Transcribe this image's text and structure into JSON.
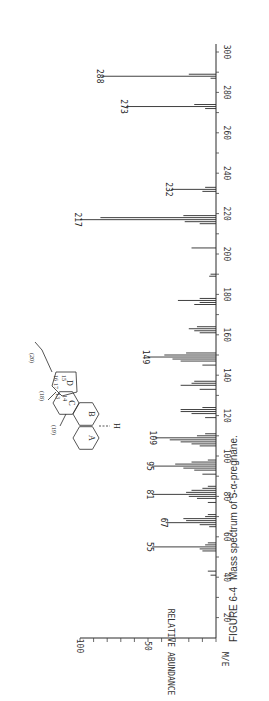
{
  "caption": {
    "figure": "FIGURE 6-4",
    "text": "Mass spectrum of 5-α-pregnane."
  },
  "axes": {
    "x_label": "M/E",
    "y_label": "RELATIVE ABUNDANCE",
    "x_ticks": [
      20,
      40,
      60,
      80,
      100,
      120,
      140,
      160,
      180,
      200,
      220,
      240,
      260,
      280,
      300
    ],
    "y_ticks": [
      50,
      100
    ]
  },
  "molecule": {
    "ring_labels": [
      "A",
      "B",
      "C",
      "D"
    ],
    "position_labels": [
      "(19)",
      "(18)",
      "(20)",
      "13",
      "14",
      "15",
      "16",
      "17"
    ],
    "h_label": "H"
  },
  "chart_data": {
    "type": "bar",
    "title": "Mass spectrum of 5-α-pregnane.",
    "xlabel": "M/E",
    "ylabel": "RELATIVE ABUNDANCE",
    "xlim": [
      20,
      300
    ],
    "ylim": [
      0,
      100
    ],
    "orientation": "rotated-90 (m/e axis vertical, abundance horizontal)",
    "grid": false,
    "labeled_peaks": [
      55,
      67,
      81,
      95,
      109,
      149,
      217,
      232,
      273,
      288
    ],
    "peaks": [
      {
        "mz": 41,
        "abundance": 4
      },
      {
        "mz": 43,
        "abundance": 6
      },
      {
        "mz": 53,
        "abundance": 10
      },
      {
        "mz": 54,
        "abundance": 12
      },
      {
        "mz": 55,
        "abundance": 47
      },
      {
        "mz": 56,
        "abundance": 8
      },
      {
        "mz": 57,
        "abundance": 6
      },
      {
        "mz": 65,
        "abundance": 5
      },
      {
        "mz": 66,
        "abundance": 12
      },
      {
        "mz": 67,
        "abundance": 37
      },
      {
        "mz": 68,
        "abundance": 22
      },
      {
        "mz": 69,
        "abundance": 24
      },
      {
        "mz": 70,
        "abundance": 8
      },
      {
        "mz": 71,
        "abundance": 6
      },
      {
        "mz": 77,
        "abundance": 6
      },
      {
        "mz": 79,
        "abundance": 14
      },
      {
        "mz": 80,
        "abundance": 20
      },
      {
        "mz": 81,
        "abundance": 47
      },
      {
        "mz": 82,
        "abundance": 22
      },
      {
        "mz": 83,
        "abundance": 18
      },
      {
        "mz": 84,
        "abundance": 10
      },
      {
        "mz": 85,
        "abundance": 6
      },
      {
        "mz": 91,
        "abundance": 10
      },
      {
        "mz": 93,
        "abundance": 16
      },
      {
        "mz": 94,
        "abundance": 24
      },
      {
        "mz": 95,
        "abundance": 47
      },
      {
        "mz": 96,
        "abundance": 30
      },
      {
        "mz": 97,
        "abundance": 18
      },
      {
        "mz": 98,
        "abundance": 6
      },
      {
        "mz": 105,
        "abundance": 12
      },
      {
        "mz": 106,
        "abundance": 18
      },
      {
        "mz": 107,
        "abundance": 26
      },
      {
        "mz": 108,
        "abundance": 34
      },
      {
        "mz": 109,
        "abundance": 45
      },
      {
        "mz": 110,
        "abundance": 14
      },
      {
        "mz": 111,
        "abundance": 8
      },
      {
        "mz": 119,
        "abundance": 8
      },
      {
        "mz": 121,
        "abundance": 18
      },
      {
        "mz": 122,
        "abundance": 26
      },
      {
        "mz": 123,
        "abundance": 26
      },
      {
        "mz": 124,
        "abundance": 10
      },
      {
        "mz": 133,
        "abundance": 12
      },
      {
        "mz": 135,
        "abundance": 26
      },
      {
        "mz": 136,
        "abundance": 18
      },
      {
        "mz": 137,
        "abundance": 16
      },
      {
        "mz": 145,
        "abundance": 10
      },
      {
        "mz": 147,
        "abundance": 26
      },
      {
        "mz": 148,
        "abundance": 32
      },
      {
        "mz": 149,
        "abundance": 50
      },
      {
        "mz": 150,
        "abundance": 38
      },
      {
        "mz": 151,
        "abundance": 22
      },
      {
        "mz": 161,
        "abundance": 12
      },
      {
        "mz": 162,
        "abundance": 16
      },
      {
        "mz": 163,
        "abundance": 20
      },
      {
        "mz": 164,
        "abundance": 14
      },
      {
        "mz": 175,
        "abundance": 16
      },
      {
        "mz": 176,
        "abundance": 12
      },
      {
        "mz": 177,
        "abundance": 28
      },
      {
        "mz": 178,
        "abundance": 12
      },
      {
        "mz": 189,
        "abundance": 5
      },
      {
        "mz": 190,
        "abundance": 4
      },
      {
        "mz": 203,
        "abundance": 18
      },
      {
        "mz": 215,
        "abundance": 12
      },
      {
        "mz": 216,
        "abundance": 23
      },
      {
        "mz": 217,
        "abundance": 100
      },
      {
        "mz": 218,
        "abundance": 85
      },
      {
        "mz": 219,
        "abundance": 24
      },
      {
        "mz": 231,
        "abundance": 10
      },
      {
        "mz": 232,
        "abundance": 33
      },
      {
        "mz": 233,
        "abundance": 8
      },
      {
        "mz": 272,
        "abundance": 8
      },
      {
        "mz": 273,
        "abundance": 66
      },
      {
        "mz": 274,
        "abundance": 16
      },
      {
        "mz": 287,
        "abundance": 4
      },
      {
        "mz": 288,
        "abundance": 84
      },
      {
        "mz": 289,
        "abundance": 20
      }
    ]
  },
  "style": {
    "line_color": "#2a2a2a",
    "tick_color": "#444444",
    "text_color": "#333333"
  }
}
